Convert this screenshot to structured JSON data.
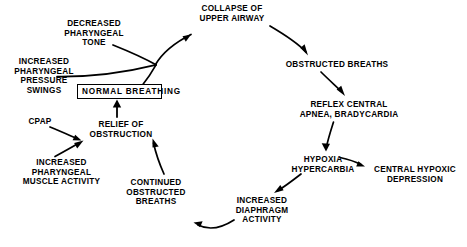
{
  "diagram": {
    "background_color": "#ffffff",
    "line_color": "#000000",
    "text_color": "#000000",
    "nodes": [
      {
        "id": "collapse-upper-airway",
        "label": "COLLAPSE OF\nUPPER AIRWAY",
        "boxed": false,
        "x": 196,
        "y": 4,
        "width": 72
      },
      {
        "id": "decreased-pharyngeal-tone",
        "label": "DECREASED\nPHARYNGEAL\nTONE",
        "boxed": false,
        "x": 60,
        "y": 19,
        "width": 68
      },
      {
        "id": "obstructed-breaths",
        "label": "OBSTRUCTED BREATHS",
        "boxed": false,
        "x": 281,
        "y": 60,
        "width": 112
      },
      {
        "id": "increased-pharyngeal-pressure-swings",
        "label": "INCREASED\nPHARYNGEAL\nPRESSURE\nSWINGS",
        "boxed": false,
        "x": 10,
        "y": 57,
        "width": 68
      },
      {
        "id": "normal-breathing",
        "label": "NORMAL BREATHING",
        "boxed": true,
        "x": 77,
        "y": 84,
        "width": 85
      },
      {
        "id": "reflex-central-apnea-bradycardia",
        "label": "REFLEX CENTRAL\nAPNEA, BRADYCARDIA",
        "boxed": false,
        "x": 295,
        "y": 100,
        "width": 108
      },
      {
        "id": "cpap",
        "label": "CPAP",
        "boxed": false,
        "x": 24,
        "y": 117,
        "width": 32
      },
      {
        "id": "relief-of-obstruction",
        "label": "RELIEF OF\nOBSTRUCTION",
        "boxed": false,
        "x": 87,
        "y": 120,
        "width": 68
      },
      {
        "id": "hypoxia-hypercarbia",
        "label": "HYPOXIA\nHYPERCARBIA",
        "boxed": false,
        "x": 290,
        "y": 155,
        "width": 66
      },
      {
        "id": "central-hypoxic-depression",
        "label": "CENTRAL HYPOXIC\nDEPRESSION",
        "boxed": false,
        "x": 370,
        "y": 165,
        "width": 90
      },
      {
        "id": "increased-pharyngeal-muscle-activity",
        "label": "INCREASED\nPHARYNGEAL\nMUSCLE ACTIVITY",
        "boxed": false,
        "x": 13,
        "y": 158,
        "width": 97
      },
      {
        "id": "continued-obstructed-breaths",
        "label": "CONTINUED\nOBSTRUCTED\nBREATHS",
        "boxed": false,
        "x": 121,
        "y": 178,
        "width": 70
      },
      {
        "id": "increased-diaphragm-activity",
        "label": "INCREASED\nDIAPHRAGM\nACTIVITY",
        "boxed": false,
        "x": 227,
        "y": 196,
        "width": 70
      }
    ],
    "edges": [
      {
        "id": "edge-merge-to-collapse",
        "from": "merge-point",
        "to": "collapse-upper-airway",
        "path": "M 155.5 64.5 C 163 52 178 41 191 34.5",
        "arrowhead": true,
        "arrow_at": "191,34.5",
        "arrow_angle": -26
      },
      {
        "id": "edge-decreased-tone-to-merge",
        "from": "decreased-pharyngeal-tone",
        "to": "merge-point",
        "path": "M 113 45 C 128 51 143 58 155.5 64.5",
        "arrowhead": false
      },
      {
        "id": "edge-pressure-swings-to-merge",
        "from": "increased-pharyngeal-pressure-swings",
        "to": "merge-point",
        "path": "M 57 76 C 95 76 130 70 155.5 64.5",
        "arrowhead": false
      },
      {
        "id": "edge-normal-breathing-to-merge",
        "from": "normal-breathing",
        "to": "merge-point",
        "path": "M 143 85 C 148 78 152 71 155.5 64.5",
        "arrowhead": false
      },
      {
        "id": "edge-collapse-to-obstructed-breaths",
        "from": "collapse-upper-airway",
        "to": "obstructed-breaths",
        "path": "M 271 26 C 288 36 299 44 307 53",
        "arrowhead": true,
        "arrow_at": "307,53",
        "arrow_angle": 50
      },
      {
        "id": "edge-obstructed-breaths-to-reflex",
        "from": "obstructed-breaths",
        "to": "reflex-central-apnea-bradycardia",
        "path": "M 322 72 C 330 81 338 88 344 93",
        "arrowhead": true,
        "arrow_at": "344,93",
        "arrow_angle": 47
      },
      {
        "id": "edge-reflex-to-hypoxia",
        "from": "reflex-central-apnea-bradycardia",
        "to": "hypoxia-hypercarbia",
        "path": "M 332 122 C 329 134 327 142 326 148",
        "arrowhead": true,
        "arrow_at": "326,149",
        "arrow_angle": 82
      },
      {
        "id": "edge-hypoxia-to-central-depression",
        "from": "hypoxia-hypercarbia",
        "to": "central-hypoxic-depression",
        "path": "M 340 158 C 350 160 357 163 364 166",
        "arrowhead": true,
        "arrow_at": "364,166",
        "arrow_angle": 27
      },
      {
        "id": "edge-hypoxia-to-diaphragm",
        "from": "hypoxia-hypercarbia",
        "to": "increased-diaphragm-activity",
        "path": "M 302 174 C 292 182 283 188 276 192",
        "arrowhead": true,
        "arrow_at": "275,193",
        "arrow_angle": 148
      },
      {
        "id": "edge-diaphragm-to-continued-breaths",
        "from": "increased-diaphragm-activity",
        "to": "continued-obstructed-breaths",
        "path": "M 229 219 C 216 228 205 230 194 224",
        "arrowhead": true,
        "arrow_at": "193,223.5",
        "arrow_angle": 203
      },
      {
        "id": "edge-continued-breaths-to-relief",
        "from": "continued-obstructed-breaths",
        "to": "relief-of-obstruction",
        "path": "M 164 174 C 159 165 155 153 153 141",
        "arrowhead": true,
        "arrow_at": "152.5,140",
        "arrow_angle": -100
      },
      {
        "id": "edge-relief-to-normal-breathing",
        "from": "relief-of-obstruction",
        "to": "normal-breathing",
        "path": "M 117 116 L 117 102",
        "arrowhead": true,
        "arrow_at": "117,101",
        "arrow_angle": -90
      },
      {
        "id": "edge-cpap-to-relief",
        "from": "cpap",
        "to": "relief-of-obstruction",
        "path": "M 50 127 C 62 132 72 136 80 140",
        "arrowhead": true,
        "arrow_at": "81,140.5",
        "arrow_angle": 27
      },
      {
        "id": "edge-muscle-activity-to-relief",
        "from": "increased-pharyngeal-muscle-activity",
        "to": "relief-of-obstruction",
        "path": "M 55 156 C 66 150 76 145 82 141",
        "arrowhead": true,
        "arrow_at": "83,140.5",
        "arrow_angle": -32
      }
    ]
  }
}
